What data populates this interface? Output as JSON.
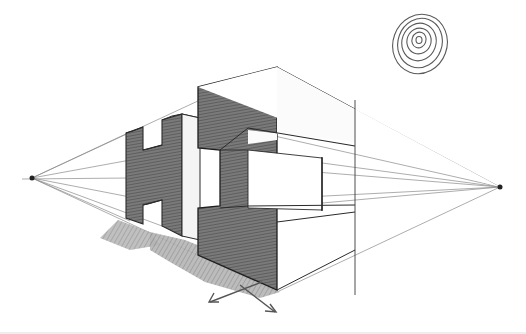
{
  "image": {
    "subject": "Pencil sketch of block letters H and I drawn in two-point perspective",
    "caption_text": "",
    "elements": {
      "vanishing_points": [
        {
          "name": "left",
          "x": 32,
          "y": 178
        },
        {
          "name": "right",
          "x": 500,
          "y": 187
        }
      ],
      "letters": [
        "H",
        "I"
      ],
      "sun": {
        "type": "spiral",
        "cx": 420,
        "cy": 45,
        "r": 28
      },
      "arrows": 2
    },
    "colors": {
      "background": "#ffffff",
      "pencil": "#3a3a3a",
      "shade": "#6b6b6b",
      "light_line": "#9a9a9a"
    }
  }
}
